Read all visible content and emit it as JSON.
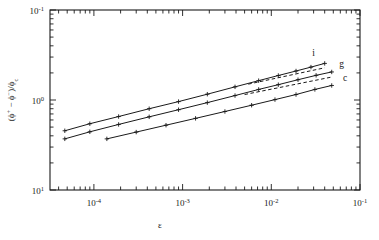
{
  "chart_data": {
    "type": "line",
    "title": "",
    "xlabel": "ε",
    "ylabel": "(ϕ⁺ - ϕ⁻)/ϕc",
    "xscale": "log",
    "yscale": "log",
    "xlim": [
      3.2e-05,
      0.1
    ],
    "ylim": [
      0.1,
      10
    ],
    "xticks": [
      "10-4",
      "10-3",
      "10-2",
      "10-1"
    ],
    "xtick_values": [
      0.0001,
      0.001,
      0.01,
      0.1
    ],
    "yticks": [
      "10-1",
      "100",
      "101"
    ],
    "ytick_values": [
      0.1,
      1,
      10
    ],
    "grid": false,
    "legend": "inline-right-labels",
    "marker": "cross",
    "series": [
      {
        "name": "i",
        "label": "i",
        "style": "solid-with-markers",
        "x": [
          4.7e-05,
          9e-05,
          0.00019,
          0.00042,
          0.0009,
          0.0019,
          0.0039,
          0.0072,
          0.012,
          0.019,
          0.028,
          0.04
        ],
        "y": [
          0.455,
          0.545,
          0.655,
          0.8,
          0.96,
          1.16,
          1.4,
          1.64,
          1.87,
          2.1,
          2.32,
          2.55
        ]
      },
      {
        "name": "g",
        "label": "g",
        "style": "solid-with-markers",
        "x": [
          4.7e-05,
          9e-05,
          0.00019,
          0.00042,
          0.0009,
          0.0019,
          0.0039,
          0.0072,
          0.012,
          0.02,
          0.032,
          0.048
        ],
        "y": [
          0.37,
          0.443,
          0.535,
          0.65,
          0.78,
          0.935,
          1.12,
          1.31,
          1.48,
          1.68,
          1.88,
          2.05
        ]
      },
      {
        "name": "c",
        "label": "c",
        "style": "solid-with-markers",
        "x": [
          0.00014,
          0.0003,
          0.00065,
          0.0014,
          0.003,
          0.006,
          0.011,
          0.019,
          0.031,
          0.048
        ],
        "y": [
          0.37,
          0.44,
          0.525,
          0.625,
          0.745,
          0.875,
          1.01,
          1.15,
          1.31,
          1.45
        ]
      },
      {
        "name": "i-asymptote",
        "label": "",
        "style": "dashed",
        "x": [
          0.0055,
          0.04
        ],
        "y": [
          1.5,
          2.28
        ]
      },
      {
        "name": "g-asymptote",
        "label": "",
        "style": "dashed",
        "x": [
          0.005,
          0.048
        ],
        "y": [
          1.15,
          1.8
        ]
      }
    ],
    "annotations": [
      {
        "text": "i",
        "x": 0.03,
        "y": 3.1
      },
      {
        "text": "g",
        "x": 0.062,
        "y": 2.35
      },
      {
        "text": "c",
        "x": 0.068,
        "y": 1.62
      }
    ]
  },
  "axes": {
    "x_label": "ε",
    "y_label_parts": [
      "(",
      "ϕ",
      "+",
      " − ",
      "ϕ",
      "−",
      ")/",
      "ϕ",
      "c"
    ],
    "x_tick_labels": [
      {
        "mantissa": "10",
        "exponent": "-4"
      },
      {
        "mantissa": "10",
        "exponent": "-3"
      },
      {
        "mantissa": "10",
        "exponent": "-2"
      },
      {
        "mantissa": "10",
        "exponent": "-1"
      }
    ],
    "y_tick_labels": [
      {
        "mantissa": "10",
        "exponent": "1"
      },
      {
        "mantissa": "10",
        "exponent": "0"
      },
      {
        "mantissa": "10",
        "exponent": "-1"
      }
    ]
  }
}
